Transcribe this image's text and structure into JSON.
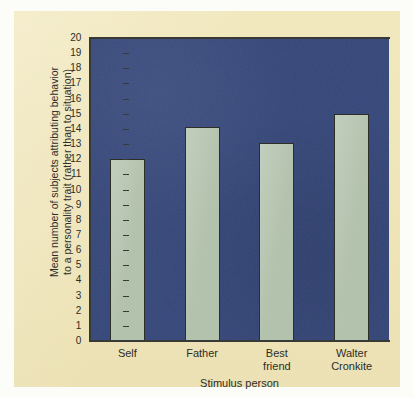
{
  "chart_data": {
    "type": "bar",
    "title": "",
    "subtitle": "",
    "xlabel": "Stimulus person",
    "ylabel_line1": "Mean number of subjects attributing behavior",
    "ylabel_line2": "to a personality trait (rather than to situation)",
    "categories": [
      "Self",
      "Father",
      "Best friend",
      "Walter Cronkite"
    ],
    "category_lines": [
      [
        "Self"
      ],
      [
        "Father"
      ],
      [
        "Best",
        "friend"
      ],
      [
        "Walter",
        "Cronkite"
      ]
    ],
    "values": [
      12.0,
      14.1,
      13.1,
      15.0
    ],
    "ylim": [
      0,
      20
    ],
    "ytick_step": 1,
    "ytick_labels": [
      "20",
      "19",
      "18",
      "17",
      "16",
      "15",
      "14",
      "13",
      "12",
      "11",
      "10",
      "9",
      "8",
      "7",
      "6",
      "5",
      "4",
      "3",
      "2",
      "1",
      "0"
    ],
    "grid": false,
    "legend": null,
    "legend_position": "none",
    "colors": {
      "bar_fill": "#b3c2ad",
      "bar_edge": "#2e2e29",
      "plot_background": "#35477a",
      "paper_background": "#f1e7bb",
      "axis": "#3a3a34",
      "text": "#2d2d28"
    }
  }
}
